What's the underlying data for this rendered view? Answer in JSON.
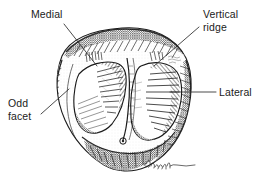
{
  "figure": {
    "background_color": "#ffffff",
    "ink_color": "#1b1b1b",
    "signature": "Farnham"
  },
  "labels": [
    {
      "id": "medial",
      "text": "Medial",
      "leader": {
        "x1": 64,
        "y1": 24,
        "x2": 97,
        "y2": 66
      }
    },
    {
      "id": "vertical-ridge",
      "text": "Vertical\nridge",
      "leader": {
        "x1": 199,
        "y1": 27,
        "x2": 154,
        "y2": 66
      }
    },
    {
      "id": "lateral",
      "text": "Lateral",
      "leader": {
        "x1": 216,
        "y1": 92,
        "x2": 170,
        "y2": 92
      }
    },
    {
      "id": "odd-facet",
      "text": "Odd\nfacet",
      "leader": {
        "x1": 41,
        "y1": 114,
        "x2": 69,
        "y2": 89
      }
    }
  ],
  "drawing": {
    "outline_label": "patella-outline",
    "medial_facet_label": "medial-facet",
    "lateral_facet_label": "lateral-facet",
    "odd_facet_label": "odd-facet-region",
    "ridge_label": "vertical-ridge-line"
  }
}
